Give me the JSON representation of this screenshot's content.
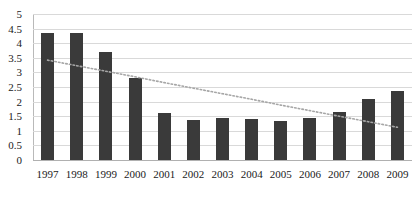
{
  "chart_data": {
    "type": "bar",
    "title": "",
    "xlabel": "",
    "ylabel": "",
    "categories": [
      "1997",
      "1998",
      "1999",
      "2000",
      "2001",
      "2002",
      "2003",
      "2004",
      "2005",
      "2006",
      "2007",
      "2008",
      "2009"
    ],
    "values": [
      4.35,
      4.35,
      3.7,
      2.8,
      1.6,
      1.37,
      1.45,
      1.4,
      1.35,
      1.45,
      1.65,
      2.1,
      2.35
    ],
    "series": [
      {
        "name": "Bars",
        "type": "bar",
        "values": [
          4.35,
          4.35,
          3.7,
          2.8,
          1.6,
          1.37,
          1.45,
          1.4,
          1.35,
          1.45,
          1.65,
          2.1,
          2.35
        ]
      },
      {
        "name": "Linear trendline",
        "type": "line",
        "style": "dotted",
        "values": [
          3.42,
          3.23,
          3.04,
          2.85,
          2.65,
          2.46,
          2.27,
          2.08,
          1.88,
          1.69,
          1.5,
          1.31,
          1.12
        ]
      }
    ],
    "ylim": [
      0,
      5
    ],
    "yticks": [
      0,
      0.5,
      1,
      1.5,
      2,
      2.5,
      3,
      3.5,
      4,
      4.5,
      5
    ],
    "ytick_labels": [
      "0",
      "0.5",
      "1",
      "1.5",
      "2",
      "2.5",
      "3",
      "3.5",
      "4",
      "4.5",
      "5"
    ],
    "grid": true,
    "legend": "none",
    "bar_color": "#3a3a3a",
    "grid_color": "#d9d9d9",
    "trendline_color": "#a6a6a6",
    "background_color": "#ffffff"
  }
}
